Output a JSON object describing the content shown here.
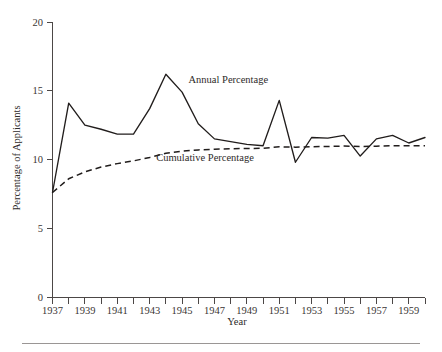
{
  "chart_data": {
    "type": "line",
    "title": "",
    "xlabel": "Year",
    "ylabel": "Percentage of Applicants",
    "xlim": [
      1937,
      1960
    ],
    "ylim": [
      0,
      20
    ],
    "grid": false,
    "legend_position": "inline-annotation",
    "x": [
      1937,
      1938,
      1939,
      1940,
      1941,
      1942,
      1943,
      1944,
      1945,
      1946,
      1947,
      1948,
      1949,
      1950,
      1951,
      1952,
      1953,
      1954,
      1955,
      1956,
      1957,
      1958,
      1959,
      1960
    ],
    "x_tick_labels": [
      "1937",
      "",
      "1939",
      "",
      "1941",
      "",
      "1943",
      "",
      "1945",
      "",
      "1947",
      "",
      "1949",
      "",
      "1951",
      "",
      "1953",
      "",
      "1955",
      "",
      "1957",
      "",
      "1959",
      ""
    ],
    "y_ticks": [
      0,
      5,
      10,
      15,
      20
    ],
    "y_tick_labels": [
      "0",
      "5",
      "10",
      "15",
      "20"
    ],
    "series": [
      {
        "name": "Annual Percentage",
        "style": "solid",
        "label_x": 1945.4,
        "label_y": 15.6,
        "values": [
          7.6,
          14.1,
          12.5,
          12.2,
          11.85,
          11.85,
          13.7,
          16.2,
          14.9,
          12.6,
          11.5,
          11.3,
          11.1,
          11.0,
          14.3,
          9.8,
          11.6,
          11.55,
          11.75,
          10.25,
          11.5,
          11.75,
          11.2,
          11.6
        ]
      },
      {
        "name": "Cumulative Percentage",
        "style": "dashed",
        "label_x": 1943.4,
        "label_y": 9.9,
        "values": [
          7.6,
          8.6,
          9.1,
          9.45,
          9.7,
          9.9,
          10.15,
          10.45,
          10.6,
          10.7,
          10.75,
          10.78,
          10.8,
          10.82,
          10.92,
          10.9,
          10.93,
          10.95,
          10.98,
          10.95,
          10.97,
          11.0,
          11.0,
          11.0
        ]
      }
    ]
  },
  "axes": {
    "y_title": "Percentage of Applicants",
    "x_title": "Year"
  }
}
